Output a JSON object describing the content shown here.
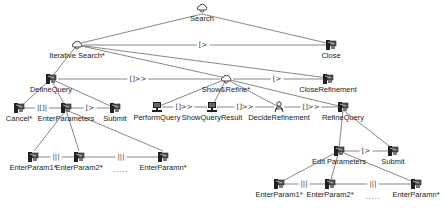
{
  "diagram": {
    "type": "task-model-tree",
    "colors": {
      "line": "#555555",
      "text": "#222222",
      "icon": "#333333"
    },
    "nodes": {
      "search": {
        "label": "Search",
        "icon": "abstract-task-cloud-icon"
      },
      "iterative_search": {
        "label": "Iterative Search*",
        "icon": "abstract-task-cloud-icon"
      },
      "close": {
        "label": "Close",
        "icon": "interaction-task-icon"
      },
      "define_query": {
        "label": "DefineQuery",
        "icon": "interaction-task-icon"
      },
      "show_refine": {
        "label": "Show&Refine*",
        "icon": "abstract-task-cloud-icon"
      },
      "close_refinement": {
        "label": "CloseRefinement",
        "icon": "interaction-task-icon"
      },
      "cancel": {
        "label": "Cancel*",
        "icon": "interaction-task-icon"
      },
      "enter_parameters": {
        "label": "EnterParameters",
        "icon": "interaction-task-icon"
      },
      "submit_1": {
        "label": "Submit",
        "icon": "interaction-task-icon"
      },
      "perform_query": {
        "label": "PerformQuery",
        "icon": "application-task-computer-icon"
      },
      "show_query_result": {
        "label": "ShowQueryResult",
        "icon": "application-task-computer-icon"
      },
      "decide_refinement": {
        "label": "DecideRefinement",
        "icon": "user-task-person-icon"
      },
      "refine_query": {
        "label": "RefineQuery",
        "icon": "interaction-task-icon"
      },
      "enter_param1_a": {
        "label": "EnterParam1*",
        "icon": "interaction-task-icon"
      },
      "enter_param2_a": {
        "label": "EnterParam2*",
        "icon": "interaction-task-icon"
      },
      "enter_paramn_a": {
        "label": "EnterParamn*",
        "icon": "interaction-task-icon"
      },
      "edit_parameters": {
        "label": "Edit Parameters",
        "icon": "interaction-task-icon"
      },
      "submit_2": {
        "label": "Submit",
        "icon": "interaction-task-icon"
      },
      "enter_param1_b": {
        "label": "EnterParam1*",
        "icon": "interaction-task-icon"
      },
      "enter_param2_b": {
        "label": "EnterParam2*",
        "icon": "interaction-task-icon"
      },
      "enter_paramn_b": {
        "label": "EnterParamn*",
        "icon": "interaction-task-icon"
      }
    },
    "operators": {
      "iter_close": "[>",
      "define_show": "[]>>",
      "show_closeref": "[>",
      "cancel_enter": "|[]|",
      "enter_submit1": "[>",
      "perform_show": "[]>>",
      "show_decide": "[]>>",
      "decide_refine": "[]>>",
      "edit_submit2": "[>",
      "p1_p2_a": "|||",
      "p2_pn_a": "|||",
      "p1_p2_b": "|||",
      "p2_pn_b": "|||"
    },
    "ellipsis_a": ".....",
    "ellipsis_b": "....."
  }
}
